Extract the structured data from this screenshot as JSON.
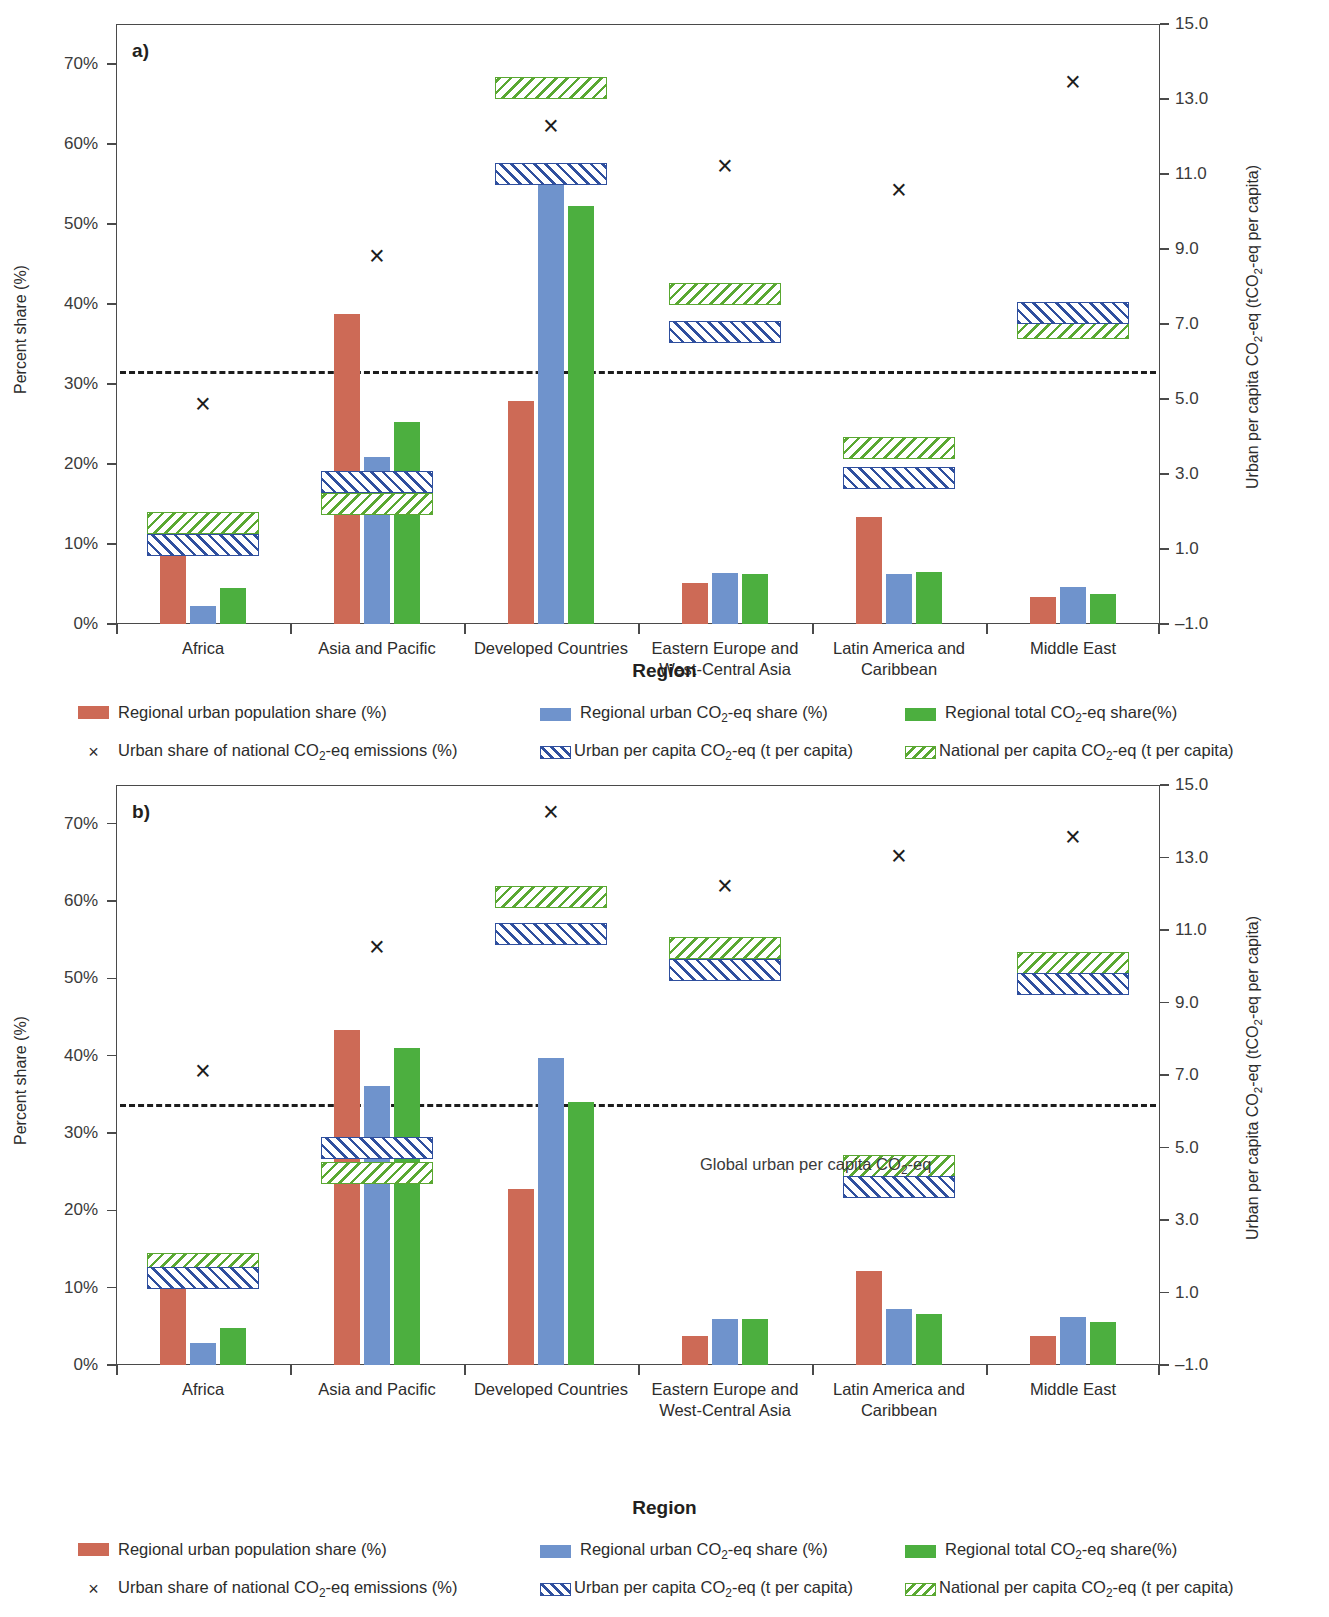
{
  "meta": {
    "panel_a_letter": "a)",
    "panel_b_letter": "b)",
    "xaxis_name": "Region",
    "yaxis_left_title": "Percent share (%)",
    "yaxis_right_title": "Urban per capita CO₂-eq (tCO₂-eq per capita)",
    "annotation_b": "Global urban per capita CO₂-eq"
  },
  "legend": {
    "items": [
      {
        "key": "urban_pop_share",
        "marker": "red-swatch",
        "label": "Regional urban population share (%)"
      },
      {
        "key": "urban_co2_share",
        "marker": "blue-swatch",
        "label": "Regional urban CO₂-eq share (%)"
      },
      {
        "key": "total_co2_share",
        "marker": "green-swatch",
        "label": "Regional total CO₂-eq share(%)"
      },
      {
        "key": "urban_share_nat",
        "marker": "x-marker",
        "label": "Urban share of national CO₂-eq emissions (%)"
      },
      {
        "key": "urban_percap",
        "marker": "blue-hatch-swatch",
        "label": "Urban per capita CO₂-eq (t per capita)"
      },
      {
        "key": "national_percap",
        "marker": "green-hatch-swatch",
        "label": "National per capita CO₂-eq (t per capita)"
      }
    ],
    "x_symbol": "×"
  },
  "chart_data": [
    {
      "id": "panel-a",
      "type": "bar",
      "title": "a)",
      "xlabel": "Region",
      "ylabel": "Percent share (%)",
      "y2label": "Urban per capita CO₂-eq (tCO₂-eq per capita)",
      "ylim": [
        0,
        75
      ],
      "yticks": [
        "0%",
        "10%",
        "20%",
        "30%",
        "40%",
        "50%",
        "60%",
        "70%"
      ],
      "ytick_values": [
        0,
        10,
        20,
        30,
        40,
        50,
        60,
        70
      ],
      "y2lim": [
        -1.0,
        15.0
      ],
      "y2ticks": [
        "-1.0",
        "1.0",
        "3.0",
        "5.0",
        "7.0",
        "9.0",
        "11.0",
        "13.0",
        "15.0"
      ],
      "y2tick_values": [
        -1.0,
        1.0,
        3.0,
        5.0,
        7.0,
        9.0,
        11.0,
        13.0,
        15.0
      ],
      "grid": false,
      "legend_position": "below",
      "categories": [
        "Africa",
        "Asia and Pacific",
        "Developed Countries",
        "Eastern Europe and\nWest-Central Asia",
        "Latin America and\nCaribbean",
        "Middle East"
      ],
      "series": [
        {
          "name": "Regional urban population share (%)",
          "axis": "left",
          "values": [
            9.6,
            38.7,
            27.9,
            5.1,
            13.4,
            3.4
          ]
        },
        {
          "name": "Regional urban CO₂-eq share (%)",
          "axis": "left",
          "values": [
            2.2,
            20.9,
            57.5,
            6.4,
            6.3,
            4.6
          ]
        },
        {
          "name": "Regional total CO₂-eq share(%)",
          "axis": "left",
          "values": [
            4.5,
            25.3,
            52.2,
            6.2,
            6.5,
            3.7
          ]
        }
      ],
      "markers": {
        "name": "Urban share of national CO₂-eq emissions (%)",
        "axis": "left",
        "values": [
          27.5,
          46.0,
          62.2,
          57.3,
          54.3,
          67.8
        ]
      },
      "bands": {
        "urban_per_capita": {
          "name": "Urban per capita CO₂-eq (t per capita)",
          "axis": "right",
          "values": [
            1.1,
            2.8,
            11.0,
            6.8,
            2.9,
            7.3
          ]
        },
        "national_per_capita": {
          "name": "National per capita CO₂-eq (t per capita)",
          "axis": "right",
          "values": [
            1.7,
            2.2,
            13.3,
            7.8,
            3.7,
            6.9
          ]
        }
      },
      "reference_line": {
        "label": "Global urban per capita CO₂-eq",
        "axis": "right",
        "value": 5.75
      }
    },
    {
      "id": "panel-b",
      "type": "bar",
      "title": "b)",
      "xlabel": "Region",
      "ylabel": "Percent share (%)",
      "y2label": "Urban per capita CO₂-eq (tCO₂-eq per capita)",
      "ylim": [
        0,
        75
      ],
      "yticks": [
        "0%",
        "10%",
        "20%",
        "30%",
        "40%",
        "50%",
        "60%",
        "70%"
      ],
      "ytick_values": [
        0,
        10,
        20,
        30,
        40,
        50,
        60,
        70
      ],
      "y2lim": [
        -1.0,
        15.0
      ],
      "y2ticks": [
        "-1.0",
        "1.0",
        "3.0",
        "5.0",
        "7.0",
        "9.0",
        "11.0",
        "13.0",
        "15.0"
      ],
      "y2tick_values": [
        -1.0,
        1.0,
        3.0,
        5.0,
        7.0,
        9.0,
        11.0,
        13.0,
        15.0
      ],
      "grid": false,
      "legend_position": "below",
      "categories": [
        "Africa",
        "Asia and Pacific",
        "Developed Countries",
        "Eastern Europe and\nWest-Central Asia",
        "Latin America and\nCaribbean",
        "Middle East"
      ],
      "series": [
        {
          "name": "Regional urban population share (%)",
          "axis": "left",
          "values": [
            10.8,
            43.3,
            22.8,
            3.7,
            12.2,
            3.8
          ]
        },
        {
          "name": "Regional urban CO₂-eq share (%)",
          "axis": "left",
          "values": [
            2.9,
            36.1,
            39.7,
            6.0,
            7.2,
            6.2
          ]
        },
        {
          "name": "Regional total CO₂-eq share(%)",
          "axis": "left",
          "values": [
            4.8,
            41.0,
            34.0,
            5.9,
            6.6,
            5.5
          ]
        }
      ],
      "markers": {
        "name": "Urban share of national CO₂-eq emissions (%)",
        "axis": "left",
        "values": [
          38.0,
          54.0,
          71.5,
          62.0,
          65.8,
          68.3
        ]
      },
      "bands": {
        "urban_per_capita": {
          "name": "Urban per capita CO₂-eq (t per capita)",
          "axis": "right",
          "values": [
            1.4,
            5.0,
            10.9,
            9.9,
            3.9,
            9.5
          ]
        },
        "national_per_capita": {
          "name": "National per capita CO₂-eq (t per capita)",
          "axis": "right",
          "values": [
            1.8,
            4.3,
            11.9,
            10.5,
            4.5,
            10.1
          ]
        }
      },
      "reference_line": {
        "label": "Global urban per capita CO₂-eq",
        "axis": "right",
        "value": 6.2
      }
    }
  ]
}
